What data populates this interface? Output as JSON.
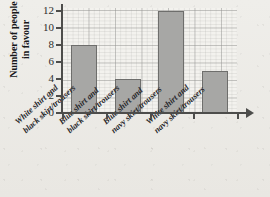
{
  "chart_data": {
    "type": "bar",
    "title": "",
    "xlabel": "",
    "ylabel": "Number of people in favour",
    "ylabel_line1": "Number of people",
    "ylabel_line2": "in favour",
    "categories": [
      "White shirt and black skirt/trousers",
      "Blue shirt and black skirt/trousers",
      "Blue shirt and navy skirt/trousers",
      "White shirt and navy skirt/trousers"
    ],
    "category_lines": [
      {
        "line1": "White shirt and",
        "line2": "black skirt/trousers"
      },
      {
        "line1": "Blue shirt and",
        "line2": "black skirt/trousers"
      },
      {
        "line1": "Blue shirt and",
        "line2": "navy skirt/trousers"
      },
      {
        "line1": "White shirt and",
        "line2": "navy skirt/trousers"
      }
    ],
    "values": [
      8,
      4,
      12,
      5
    ],
    "ylim": [
      0,
      12
    ],
    "yticks": [
      0,
      2,
      4,
      6,
      8,
      10,
      12
    ],
    "ytick_labels": [
      "0",
      "2",
      "4",
      "6",
      "8",
      "10",
      "12"
    ],
    "grid": true,
    "legend": "none",
    "bar_color": "#a7a7a5",
    "bar_border_color": "#6e6e6c",
    "axis_color": "#4d4d4b",
    "background_color": "#f3f2ee"
  }
}
